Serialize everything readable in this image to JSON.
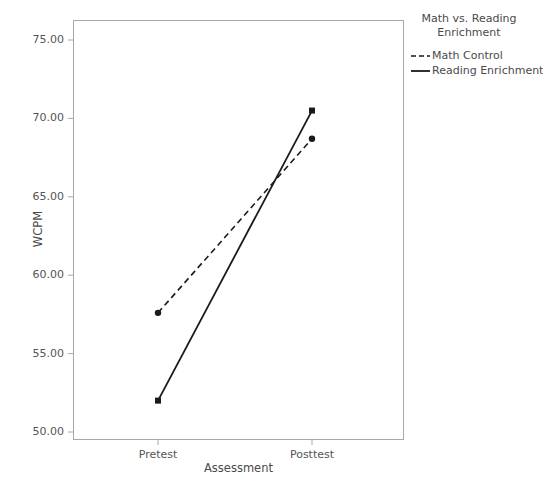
{
  "chart_data": {
    "type": "line",
    "title": "Math vs. Reading Enrichment",
    "xlabel": "Assessment",
    "ylabel": "WCPM",
    "categories": [
      "Pretest",
      "Posttest"
    ],
    "ylim": [
      50.0,
      75.0
    ],
    "ytick_labels": [
      "75.00",
      "70.00",
      "65.00",
      "60.00",
      "55.00",
      "50.00"
    ],
    "ytick_values": [
      75.0,
      70.0,
      65.0,
      60.0,
      55.0,
      50.0
    ],
    "grid": false,
    "legend_position": "top-right",
    "series": [
      {
        "name": "Math Control",
        "values": [
          57.6,
          68.7
        ],
        "style": "dashed",
        "color": "#1a1a1a",
        "marker": "circle"
      },
      {
        "name": "Reading Enrichment",
        "values": [
          52.0,
          70.5
        ],
        "style": "solid",
        "color": "#1a1a1a",
        "marker": "square"
      }
    ]
  },
  "legend": {
    "title_line1": "Math vs. Reading",
    "title_line2": "Enrichment",
    "entries": [
      {
        "label": "Math Control"
      },
      {
        "label": "Reading Enrichment"
      }
    ]
  },
  "axes": {
    "y_title": "WCPM",
    "x_title": "Assessment",
    "y_labels": [
      "75.00",
      "70.00",
      "65.00",
      "60.00",
      "55.00",
      "50.00"
    ],
    "x_labels": [
      "Pretest",
      "Posttest"
    ]
  },
  "colors": {
    "background": "#ffffff",
    "frame": "#a8a8a8",
    "line": "#1a1a1a",
    "text": "#4a4a4a"
  }
}
